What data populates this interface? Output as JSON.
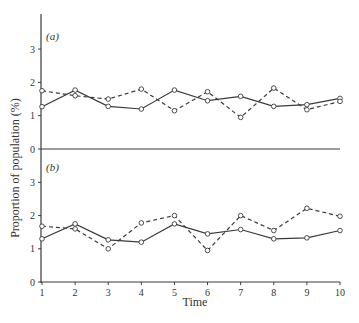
{
  "chart_data": [
    {
      "type": "line",
      "panel": "(a)",
      "x": [
        1,
        2,
        3,
        4,
        5,
        6,
        7,
        8,
        9,
        10
      ],
      "series": [
        {
          "name": "solid",
          "style": "solid",
          "values": [
            1.27,
            1.77,
            1.28,
            1.2,
            1.77,
            1.45,
            1.58,
            1.28,
            1.33,
            1.52
          ]
        },
        {
          "name": "dashed",
          "style": "dashed",
          "values": [
            1.75,
            1.6,
            1.5,
            1.8,
            1.15,
            1.72,
            0.95,
            1.83,
            1.18,
            1.43
          ]
        }
      ],
      "yticks": [
        0,
        1,
        2,
        3
      ],
      "ylim": [
        0,
        4
      ],
      "grid": false
    },
    {
      "type": "line",
      "panel": "(b)",
      "x": [
        1,
        2,
        3,
        4,
        5,
        6,
        7,
        8,
        9,
        10
      ],
      "series": [
        {
          "name": "solid",
          "style": "solid",
          "values": [
            1.3,
            1.75,
            1.27,
            1.2,
            1.75,
            1.45,
            1.58,
            1.3,
            1.33,
            1.55
          ]
        },
        {
          "name": "dashed",
          "style": "dashed",
          "values": [
            1.68,
            1.6,
            1.0,
            1.78,
            2.0,
            0.95,
            2.0,
            1.55,
            2.22,
            1.98
          ]
        }
      ],
      "yticks": [
        0,
        1,
        2,
        3
      ],
      "ylim": [
        0,
        4
      ],
      "grid": false
    }
  ],
  "labels": {
    "panel_a": "(a)",
    "panel_b": "(b)",
    "xlabel": "Time",
    "ylabel": "Proportion of population (%)",
    "xticks": [
      "1",
      "2",
      "3",
      "4",
      "5",
      "6",
      "7",
      "8",
      "9",
      "10"
    ],
    "yticks": [
      "0",
      "1",
      "2",
      "3"
    ]
  },
  "colors": {
    "line": "#3a3a3a",
    "marker_fill": "#ffffff"
  }
}
